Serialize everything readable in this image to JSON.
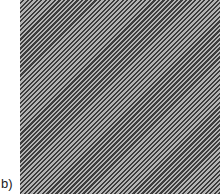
{
  "figure": {
    "panel_label": "b)",
    "pattern": {
      "type": "diagonal-stripes",
      "direction": "lower-left to upper-right",
      "colors": {
        "dark": "#3c3c3c",
        "light": "#b4b4b4"
      }
    }
  }
}
